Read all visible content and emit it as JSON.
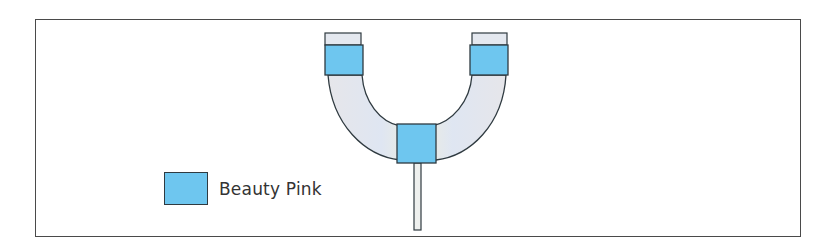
{
  "diagram": {
    "type": "u-tube-schematic",
    "colors": {
      "tube_fill": "#e4e8ef",
      "highlight_fill": "#6ec6ef",
      "stroke": "#2f3a40",
      "frame": "#4a4a4a"
    },
    "legend": {
      "items": [
        {
          "label": "Beauty Pink",
          "color": "#6ec6ef"
        }
      ]
    }
  }
}
